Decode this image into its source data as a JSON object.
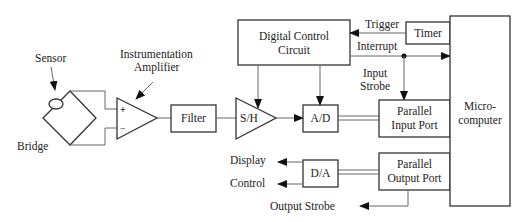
{
  "diagram": {
    "type": "block-diagram",
    "labels": {
      "sensor": "Sensor",
      "bridge": "Bridge",
      "amp_line1": "Instrumentation",
      "amp_line2": "Amplifier",
      "plus": "+",
      "minus": "−",
      "filter": "Filter",
      "sh": "S/H",
      "ad": "A/D",
      "da": "D/A",
      "dcc_line1": "Digital Control",
      "dcc_line2": "Circuit",
      "timer": "Timer",
      "trigger": "Trigger",
      "interrupt": "Interrupt",
      "input_strobe_line1": "Input",
      "input_strobe_line2": "Strobe",
      "pip_line1": "Parallel",
      "pip_line2": "Input Port",
      "pop_line1": "Parallel",
      "pop_line2": "Output Port",
      "micro_line1": "Micro-",
      "micro_line2": "computer",
      "display": "Display",
      "control": "Control",
      "output_strobe": "Output Strobe"
    },
    "nodes": [
      "Sensor",
      "Bridge",
      "Instrumentation Amplifier",
      "Filter",
      "S/H",
      "A/D",
      "Digital Control Circuit",
      "Timer",
      "Parallel Input Port",
      "Parallel Output Port",
      "Microcomputer",
      "D/A"
    ],
    "edges": [
      {
        "from": "Bridge",
        "to": "Instrumentation Amplifier"
      },
      {
        "from": "Instrumentation Amplifier",
        "to": "Filter"
      },
      {
        "from": "Filter",
        "to": "S/H"
      },
      {
        "from": "S/H",
        "to": "A/D"
      },
      {
        "from": "A/D",
        "to": "Parallel Input Port"
      },
      {
        "from": "Digital Control Circuit",
        "to": "S/H"
      },
      {
        "from": "Digital Control Circuit",
        "to": "A/D"
      },
      {
        "from": "Timer",
        "to": "Digital Control Circuit",
        "label": "Trigger"
      },
      {
        "from": "Digital Control Circuit",
        "to": "Microcomputer",
        "label": "Interrupt"
      },
      {
        "from": "Digital Control Circuit",
        "to": "Parallel Input Port",
        "label": "Input Strobe"
      },
      {
        "from": "Parallel Output Port",
        "to": "D/A"
      },
      {
        "from": "D/A",
        "to": "Display"
      },
      {
        "from": "D/A",
        "to": "Control"
      },
      {
        "from": "Parallel Output Port",
        "to": "Output Strobe"
      }
    ]
  }
}
